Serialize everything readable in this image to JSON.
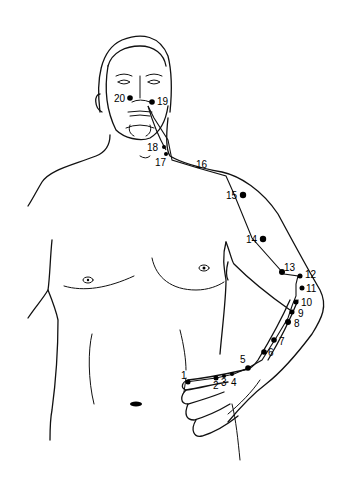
{
  "figure": {
    "line_color": "#111111",
    "point_color": "#000000",
    "background": "#ffffff"
  },
  "points": [
    {
      "id": "1",
      "label": "1"
    },
    {
      "id": "2",
      "label": "2"
    },
    {
      "id": "3",
      "label": "3"
    },
    {
      "id": "4",
      "label": "4"
    },
    {
      "id": "5",
      "label": "5"
    },
    {
      "id": "6",
      "label": "6"
    },
    {
      "id": "7",
      "label": "7"
    },
    {
      "id": "8",
      "label": "8"
    },
    {
      "id": "9",
      "label": "9"
    },
    {
      "id": "10",
      "label": "10"
    },
    {
      "id": "11",
      "label": "11"
    },
    {
      "id": "12",
      "label": "12"
    },
    {
      "id": "13",
      "label": "13"
    },
    {
      "id": "14",
      "label": "14"
    },
    {
      "id": "15",
      "label": "15"
    },
    {
      "id": "16",
      "label": "16"
    },
    {
      "id": "17",
      "label": "17"
    },
    {
      "id": "18",
      "label": "18"
    },
    {
      "id": "19",
      "label": "19"
    },
    {
      "id": "20",
      "label": "20"
    }
  ]
}
